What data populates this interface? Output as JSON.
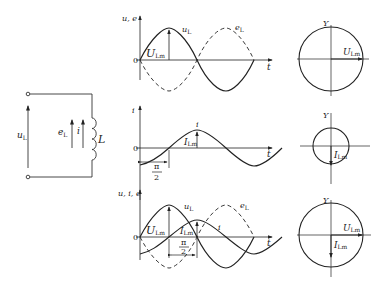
{
  "circuit": {
    "u_label": "u",
    "u_sub": "L",
    "e_label": "e",
    "e_sub": "L",
    "i_label": "i",
    "inductor_label": "L"
  },
  "graph1": {
    "y_axis_label": "u, e",
    "x_axis_label": "t",
    "origin": "0",
    "curve1_label": "u",
    "curve1_sub": "L",
    "curve2_label": "e",
    "curve2_sub": "L",
    "amp_label": "U",
    "amp_sub": "Lm"
  },
  "graph2": {
    "y_axis_label": "i",
    "x_axis_label": "t",
    "origin": "0",
    "curve_label": "i",
    "amp_label": "I",
    "amp_sub": "Lm",
    "phase_num": "π",
    "phase_den": "2"
  },
  "graph3": {
    "y_axis_label": "u, i, e",
    "x_axis_label": "t",
    "origin": "0",
    "curve1_label": "u",
    "curve1_sub": "L",
    "curve2_label": "e",
    "curve2_sub": "L",
    "curve3_label": "i",
    "amp_u_label": "U",
    "amp_u_sub": "Lm",
    "amp_i_label": "I",
    "amp_i_sub": "Lm",
    "phase_num": "π",
    "phase_den": "2"
  },
  "phasor1": {
    "axis_label": "Y",
    "vector_label": "U",
    "vector_sub": "Lm"
  },
  "phasor2": {
    "axis_label": "Y",
    "vector_label": "I",
    "vector_sub": "Lm"
  },
  "phasor3": {
    "axis_label": "Y",
    "vector1_label": "U",
    "vector1_sub": "Lm",
    "vector2_label": "I",
    "vector2_sub": "Lm"
  }
}
